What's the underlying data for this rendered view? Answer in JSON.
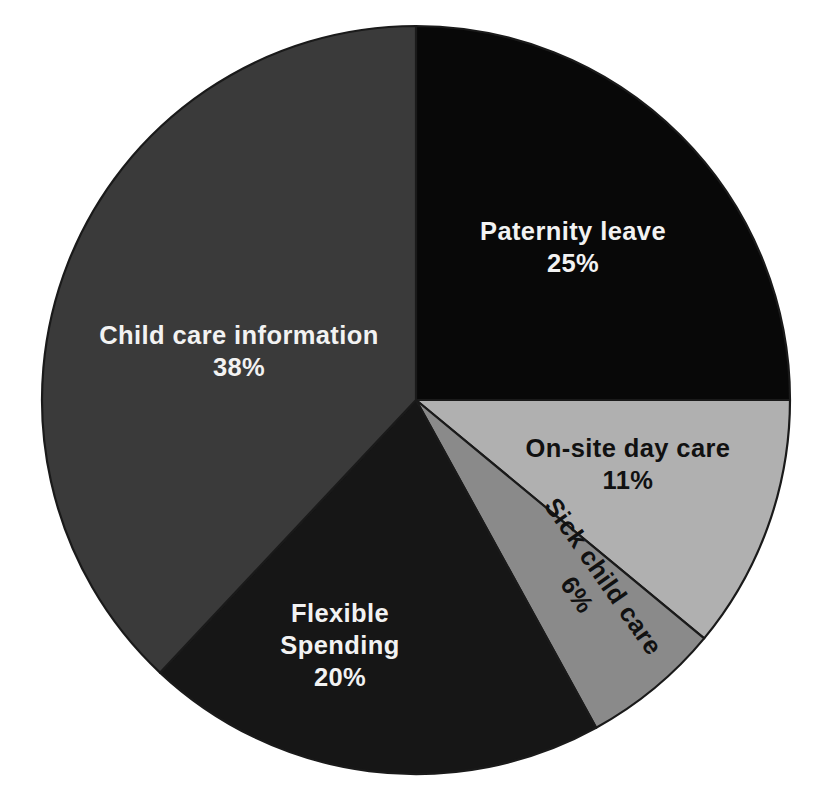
{
  "chart_data": {
    "type": "pie",
    "title": "",
    "subtitle": "",
    "xlabel": "",
    "ylabel": "",
    "legend_position": "none",
    "grid": false,
    "labels_inside_slices": true,
    "start_angle_deg": 0,
    "direction": "clockwise",
    "background_color": "#ffffff",
    "outline_color": "#1a1a1a",
    "categories": [
      "Paternity leave",
      "On-site day care",
      "Sick child care",
      "Flexible Spending",
      "Child care information"
    ],
    "values": [
      25,
      11,
      6,
      20,
      38
    ],
    "value_labels": [
      "25%",
      "11%",
      "6%",
      "20%",
      "38%"
    ],
    "colors": [
      "#080808",
      "#b0b0b0",
      "#8a8a8a",
      "#161616",
      "#3a3a3a"
    ],
    "slices": [
      {
        "name": "Paternity leave",
        "value": 25,
        "pct_label": "25%",
        "color": "#080808",
        "label_lines": [
          "Paternity leave",
          "25%"
        ],
        "label_color": "#f2f2f2",
        "label_rotation_deg": 0,
        "start_angle_deg": 0,
        "end_angle_deg": 90
      },
      {
        "name": "On-site day care",
        "value": 11,
        "pct_label": "11%",
        "color": "#b0b0b0",
        "label_lines": [
          "On-site day care",
          "11%"
        ],
        "label_color": "#111111",
        "label_rotation_deg": 0,
        "start_angle_deg": 90,
        "end_angle_deg": 129.6
      },
      {
        "name": "Sick child care",
        "value": 6,
        "pct_label": "6%",
        "color": "#8a8a8a",
        "label_lines": [
          "Sick child care",
          "6%"
        ],
        "label_color": "#111111",
        "label_rotation_deg": -55,
        "start_angle_deg": 129.6,
        "end_angle_deg": 151.2
      },
      {
        "name": "Flexible Spending",
        "value": 20,
        "pct_label": "20%",
        "color": "#161616",
        "label_lines": [
          "Flexible",
          "Spending",
          "20%"
        ],
        "label_color": "#f2f2f2",
        "label_rotation_deg": 0,
        "start_angle_deg": 151.2,
        "end_angle_deg": 223.2
      },
      {
        "name": "Child care information",
        "value": 38,
        "pct_label": "38%",
        "color": "#3a3a3a",
        "label_lines": [
          "Child care information",
          "38%"
        ],
        "label_color": "#f2f2f2",
        "label_rotation_deg": 0,
        "start_angle_deg": 223.2,
        "end_angle_deg": 360
      }
    ]
  },
  "labels": {
    "paternity_name": "Paternity leave",
    "paternity_pct": "25%",
    "onsite_name": "On-site day care",
    "onsite_pct": "11%",
    "sick_name": "Sick child care",
    "sick_pct": "6%",
    "flexible_line1": "Flexible",
    "flexible_line2": "Spending",
    "flexible_pct": "20%",
    "childcare_name": "Child care information",
    "childcare_pct": "38%"
  }
}
